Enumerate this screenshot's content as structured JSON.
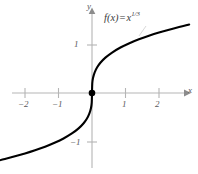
{
  "figure": {
    "name": "cube-root-function-graph",
    "background_color": "#ffffff",
    "axis_color": "#b3b3b3",
    "curve_color": "#000000",
    "label_color": "#58595b"
  },
  "annotation": {
    "function_label_prefix": "f(x)",
    "function_label_equals": "=",
    "function_label_base": "x",
    "function_label_exponent": "1/3",
    "function_label_full": "f(x) = x^(1/3)"
  },
  "axes": {
    "x_name": "x",
    "y_name": "y",
    "x_ticks": [
      {
        "value": -2,
        "label": "−2"
      },
      {
        "value": -1,
        "label": "−1"
      },
      {
        "value": 1,
        "label": "1"
      },
      {
        "value": 2,
        "label": "2"
      }
    ],
    "y_ticks": [
      {
        "value": 1,
        "label": "1"
      },
      {
        "value": -1,
        "label": "−1"
      }
    ]
  },
  "chart_data": {
    "type": "line",
    "title": "",
    "subtitle": "",
    "xlabel": "x",
    "ylabel": "y",
    "xlim": [
      -2.85,
      2.9
    ],
    "ylim": [
      -1.45,
      1.45
    ],
    "grid": false,
    "legend": null,
    "annotations": [
      {
        "text": "f(x) = x^(1/3)",
        "x": 0.6,
        "y": 1.3
      }
    ],
    "xticks": [
      -2,
      -1,
      1,
      2
    ],
    "yticks": [
      -1,
      1
    ],
    "markers": [
      {
        "x": 0,
        "y": 0,
        "style": "filled-circle",
        "label": "origin"
      }
    ],
    "series": [
      {
        "name": "f(x) = x^(1/3)",
        "color": "#000000",
        "x": [
          -2.85,
          -2.6,
          -2.3,
          -2.0,
          -1.7,
          -1.4,
          -1.1,
          -0.85,
          -0.6,
          -0.4,
          -0.25,
          -0.15,
          -0.08,
          -0.03,
          -0.008,
          0,
          0.008,
          0.03,
          0.08,
          0.15,
          0.25,
          0.4,
          0.6,
          0.85,
          1.1,
          1.4,
          1.7,
          2.0,
          2.3,
          2.6,
          2.9
        ],
        "y": [
          -1.418,
          -1.375,
          -1.32,
          -1.26,
          -1.193,
          -1.119,
          -1.032,
          -0.947,
          -0.843,
          -0.737,
          -0.63,
          -0.531,
          -0.43,
          -0.311,
          -0.2,
          0,
          0.2,
          0.311,
          0.43,
          0.531,
          0.63,
          0.737,
          0.843,
          0.947,
          1.032,
          1.119,
          1.193,
          1.26,
          1.32,
          1.375,
          1.426
        ]
      }
    ]
  }
}
